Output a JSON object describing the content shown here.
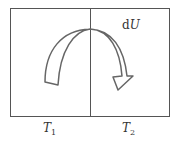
{
  "diagram": {
    "left_region_label": {
      "symbol": "T",
      "subscript": "1"
    },
    "right_region_label": {
      "symbol": "T",
      "subscript": "2"
    },
    "flow_label": {
      "prefix": "d",
      "symbol": "U"
    },
    "arrow_direction": "from T1 region to T2 region",
    "colors": {
      "line": "#555555",
      "arrow_fill": "#ffffff"
    }
  }
}
